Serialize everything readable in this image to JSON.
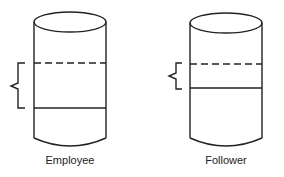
{
  "diagram": {
    "cylinders": [
      {
        "id": "employee",
        "label": "Employee"
      },
      {
        "id": "follower",
        "label": "Follower"
      }
    ],
    "colors": {
      "stroke": "#222222",
      "background": "#ffffff"
    }
  }
}
